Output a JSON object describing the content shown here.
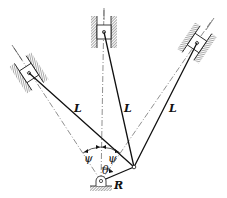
{
  "diagram": {
    "type": "mechanism",
    "labels": {
      "rod_left": "L",
      "rod_center": "L",
      "rod_right": "L",
      "angle_left": "ψ",
      "angle_right": "ψ",
      "crank_angle": "θ",
      "crank_radius": "R"
    },
    "colors": {
      "line": "#111111",
      "hatch": "#555555",
      "background": "#ffffff"
    }
  }
}
